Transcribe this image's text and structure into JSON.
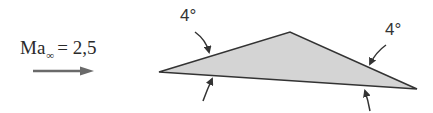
{
  "flow": {
    "mach_symbol": "Ma",
    "mach_subscript": "∞",
    "mach_equals": "= 2,5",
    "direction": "left-to-right"
  },
  "airfoil": {
    "shape": "triangular wedge",
    "fill_color": "#d4d4d4",
    "edge_color": "#333333",
    "vertices": {
      "leading_edge": [
        159,
        72
      ],
      "apex": [
        290,
        32
      ],
      "trailing_edge": [
        417,
        89
      ]
    }
  },
  "angles": {
    "front_label": "4°",
    "rear_label": "4°"
  }
}
